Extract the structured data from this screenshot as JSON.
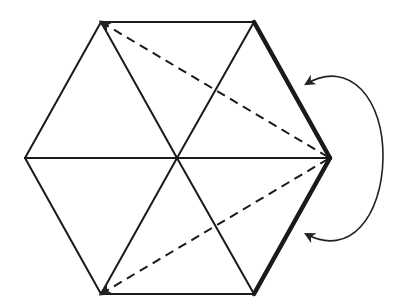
{
  "diagram": {
    "colors": {
      "stroke": "#1a1a1a",
      "background": "#ffffff"
    },
    "vertices": {
      "top_left": [
        101,
        22
      ],
      "top_right": [
        254,
        22
      ],
      "right": [
        330,
        158
      ],
      "bottom_right": [
        254,
        294
      ],
      "bottom_left": [
        101,
        294
      ],
      "left": [
        25,
        158
      ],
      "center": [
        177,
        158
      ]
    },
    "edges": {
      "outline": [
        [
          "top_left",
          "top_right"
        ],
        [
          "bottom_right",
          "bottom_left"
        ],
        [
          "bottom_left",
          "left"
        ],
        [
          "left",
          "top_left"
        ]
      ],
      "bold": [
        [
          "top_right",
          "right"
        ],
        [
          "right",
          "bottom_right"
        ]
      ],
      "spokes": [
        [
          "center",
          "top_left"
        ],
        [
          "center",
          "top_right"
        ],
        [
          "center",
          "right"
        ],
        [
          "center",
          "bottom_right"
        ],
        [
          "center",
          "bottom_left"
        ],
        [
          "center",
          "left"
        ]
      ],
      "dashed": [
        [
          "right",
          "top_left"
        ],
        [
          "right",
          "bottom_left"
        ]
      ]
    },
    "arrow": {
      "type": "curved-double-headed",
      "start": [
        306,
        84
      ],
      "end": [
        306,
        234
      ],
      "label": ""
    }
  }
}
